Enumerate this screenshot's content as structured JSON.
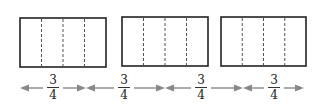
{
  "diagram": {
    "rectangles": [
      {
        "x": 20,
        "y": 18,
        "w": 86,
        "h": 49,
        "parts": 4
      },
      {
        "x": 122,
        "y": 17,
        "w": 86,
        "h": 49,
        "parts": 4
      },
      {
        "x": 221,
        "y": 17,
        "w": 85,
        "h": 49,
        "parts": 4
      }
    ],
    "arrow_segments": [
      {
        "x1": 20,
        "x2": 86,
        "label_x": 53,
        "label": {
          "numerator": "3",
          "denominator": "4"
        }
      },
      {
        "x1": 86,
        "x2": 165,
        "label_x": 124,
        "label": {
          "numerator": "3",
          "denominator": "4"
        }
      },
      {
        "x1": 165,
        "x2": 243,
        "label_x": 201,
        "label": {
          "numerator": "3",
          "denominator": "4"
        }
      },
      {
        "x1": 243,
        "x2": 304,
        "label_x": 274,
        "label": {
          "numerator": "3",
          "denominator": "4"
        }
      }
    ],
    "colors": {
      "rect_stroke": "#222222",
      "dash_stroke": "#555555",
      "arrow": "#888888"
    }
  }
}
